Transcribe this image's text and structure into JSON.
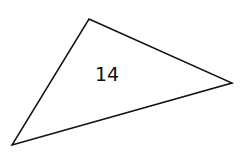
{
  "diagram": {
    "width": 242,
    "height": 155,
    "background": "#ffffff",
    "shapes": [
      {
        "type": "triangle",
        "vertices": [
          [
            89,
            19
          ],
          [
            232,
            83
          ],
          [
            12,
            145
          ]
        ],
        "stroke": "#111111",
        "stroke_width": 1.5,
        "fill": "none",
        "label": {
          "text": "14",
          "x": 107,
          "y": 74,
          "color": "#111111"
        }
      }
    ]
  }
}
